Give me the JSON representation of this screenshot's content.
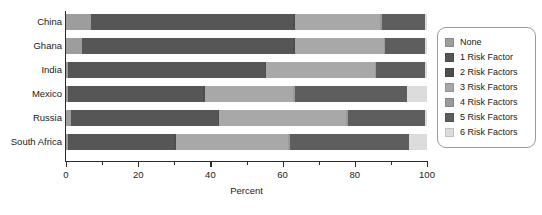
{
  "chart_data": {
    "type": "bar",
    "orientation": "horizontal",
    "stacked": true,
    "title": "",
    "xlabel": "Percent",
    "ylabel": "",
    "xlim": [
      0,
      100
    ],
    "xticks": [
      0,
      20,
      40,
      60,
      80,
      100
    ],
    "xtick_labels": [
      "0",
      "20",
      "40",
      "60",
      "80",
      "100"
    ],
    "xminor_ticks": [
      10,
      30,
      50,
      70,
      90
    ],
    "grid": false,
    "legend_position": "right",
    "categories": [
      "China",
      "Ghana",
      "India",
      "Mexico",
      "Russia",
      "South Africa"
    ],
    "series": [
      {
        "name": "None",
        "color": "#9d9d9d",
        "values": [
          7.0,
          4.5,
          0.5,
          0.5,
          1.5,
          0.5
        ]
      },
      {
        "name": "1 Risk Factor",
        "color": "#565656",
        "values": [
          56.0,
          58.5,
          54.5,
          37.5,
          40.5,
          29.5
        ]
      },
      {
        "name": "2 Risk Factors",
        "color": "#4e4e4e",
        "values": [
          0.5,
          0.5,
          0.5,
          0.5,
          0.5,
          0.5
        ]
      },
      {
        "name": "3 Risk Factors",
        "color": "#a8a8a8",
        "values": [
          23.5,
          24.5,
          30.0,
          24.5,
          35.0,
          31.0
        ]
      },
      {
        "name": "4 Risk Factors",
        "color": "#9a9a9a",
        "values": [
          0.5,
          0.5,
          0.5,
          0.5,
          0.5,
          0.5
        ]
      },
      {
        "name": "5 Risk Factors",
        "color": "#5e5e5e",
        "values": [
          12.0,
          11.0,
          13.5,
          31.0,
          21.5,
          33.0
        ]
      },
      {
        "name": "6 Risk Factors",
        "color": "#dcdcdc",
        "values": [
          0.5,
          0.5,
          0.5,
          5.5,
          0.5,
          5.0
        ]
      }
    ]
  },
  "legend": {
    "items": [
      {
        "label": "None"
      },
      {
        "label": "1 Risk Factor"
      },
      {
        "label": "2 Risk Factors"
      },
      {
        "label": "3 Risk Factors"
      },
      {
        "label": "4 Risk Factors"
      },
      {
        "label": "5 Risk Factors"
      },
      {
        "label": "6 Risk Factors"
      }
    ]
  },
  "colors": {
    "axis": "#2b2b2b",
    "text": "#1a1a1a",
    "legend_border": "#9a9a9a",
    "background": "#ffffff"
  }
}
